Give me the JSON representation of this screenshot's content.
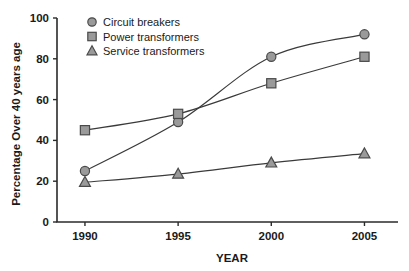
{
  "chart_data": {
    "type": "line",
    "title": "",
    "xlabel": "YEAR",
    "ylabel": "Percentage Over 40 years age",
    "x": [
      1990,
      1995,
      2000,
      2005
    ],
    "xticklabels": [
      "1990",
      "1995",
      "2000",
      "2005"
    ],
    "yticks": [
      0,
      20,
      40,
      60,
      80,
      100
    ],
    "yticklabels": [
      "0",
      "20",
      "40",
      "60",
      "80",
      "100"
    ],
    "ylim": [
      0,
      100
    ],
    "xlim": [
      1988.5,
      2006.8
    ],
    "grid": false,
    "legend_position": "top-left",
    "series": [
      {
        "name": "Circuit breakers",
        "marker": "circle",
        "values": [
          25,
          49,
          81,
          92
        ]
      },
      {
        "name": "Power transformers",
        "marker": "square",
        "values": [
          45,
          53,
          68,
          81
        ]
      },
      {
        "name": "Service transformers",
        "marker": "triangle",
        "values": [
          19.5,
          23.5,
          29,
          33.5
        ]
      }
    ],
    "colors": {
      "marker_fill": "#9a9a9a",
      "marker_stroke": "#4a4a4a",
      "line": "#3a3a3a",
      "axis": "#2b2b2b",
      "text": "#1a1a1a",
      "background": "#ffffff"
    }
  }
}
